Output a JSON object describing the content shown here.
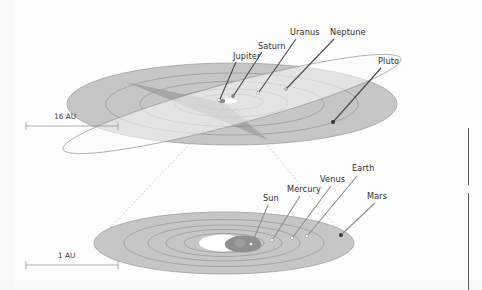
{
  "figure": {
    "background_color": "#fdfdfd",
    "label_color": "#2f2f2f",
    "disk_fill": "#c6c6c6",
    "disk_edge": "#9a9a9a",
    "wedge_fill": "#a8a8a8",
    "orbit_line_color": "#8a8a8a",
    "leader_line_color": "#4a4a4a",
    "cone_line_color": "#bdbdbd",
    "sun_blob_color": "#8f8f8f",
    "core_highlight": "#ffffff"
  },
  "outer_system": {
    "scale_label": "16 AU",
    "planets": [
      {
        "name": "Jupiter",
        "label_x": 233,
        "label_y": 57,
        "dot_x": 219,
        "dot_y": 100
      },
      {
        "name": "Saturn",
        "label_x": 258,
        "label_y": 47,
        "dot_x": 233,
        "dot_y": 96
      },
      {
        "name": "Uranus",
        "label_x": 290,
        "label_y": 33,
        "dot_x": 258,
        "dot_y": 93
      },
      {
        "name": "Neptune",
        "label_x": 330,
        "label_y": 33,
        "dot_x": 286,
        "dot_y": 89
      },
      {
        "name": "Pluto",
        "label_x": 378,
        "label_y": 62,
        "dot_x": 333,
        "dot_y": 122
      }
    ]
  },
  "inner_system": {
    "scale_label": "1 AU",
    "planets": [
      {
        "name": "Sun",
        "label_x": 263,
        "label_y": 199,
        "dot_x": 251,
        "dot_y": 244
      },
      {
        "name": "Mercury",
        "label_x": 287,
        "label_y": 190,
        "dot_x": 272,
        "dot_y": 240
      },
      {
        "name": "Venus",
        "label_x": 320,
        "label_y": 180,
        "dot_x": 292,
        "dot_y": 238
      },
      {
        "name": "Earth",
        "label_x": 352,
        "label_y": 169,
        "dot_x": 307,
        "dot_y": 236
      },
      {
        "name": "Mars",
        "label_x": 367,
        "label_y": 197,
        "dot_x": 341,
        "dot_y": 235
      }
    ]
  },
  "page_edge_rules": [
    {
      "x": 468,
      "y": 128,
      "height": 57
    },
    {
      "x": 468,
      "y": 193,
      "height": 97
    }
  ]
}
